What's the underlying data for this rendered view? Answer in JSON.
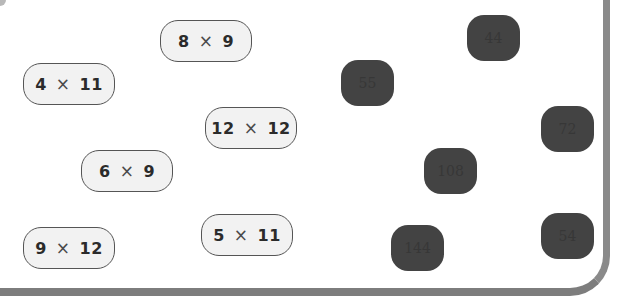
{
  "worksheet": {
    "expressions": [
      {
        "id": "8x9",
        "a": "8",
        "op": "×",
        "b": "9",
        "x": 160,
        "y": 20
      },
      {
        "id": "4x11",
        "a": "4",
        "op": "×",
        "b": "11",
        "x": 23,
        "y": 63
      },
      {
        "id": "12x12",
        "a": "12",
        "op": "×",
        "b": "12",
        "x": 205,
        "y": 107
      },
      {
        "id": "6x9",
        "a": "6",
        "op": "×",
        "b": "9",
        "x": 81,
        "y": 150
      },
      {
        "id": "5x11",
        "a": "5",
        "op": "×",
        "b": "11",
        "x": 201,
        "y": 214
      },
      {
        "id": "9x12",
        "a": "9",
        "op": "×",
        "b": "12",
        "x": 23,
        "y": 227
      }
    ],
    "answers": [
      {
        "value": "44",
        "x": 467,
        "y": 15
      },
      {
        "value": "55",
        "x": 341,
        "y": 60
      },
      {
        "value": "72",
        "x": 541,
        "y": 106
      },
      {
        "value": "108",
        "x": 424,
        "y": 148
      },
      {
        "value": "54",
        "x": 541,
        "y": 213
      },
      {
        "value": "144",
        "x": 391,
        "y": 225
      }
    ],
    "colors": {
      "expression_fill": "#f2f2f2",
      "expression_border": "#555555",
      "tile_fill": "#434343",
      "frame": "#7d7d7d"
    }
  }
}
